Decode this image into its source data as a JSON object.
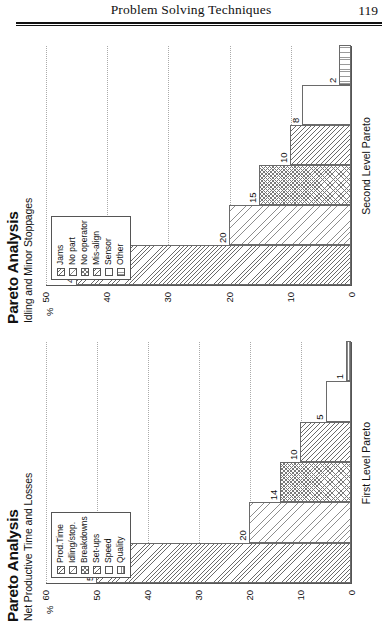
{
  "page": {
    "running_head": "Problem Solving Techniques",
    "folio": "119"
  },
  "figures": [
    {
      "id": "second-level",
      "title": "Pareto Analysis",
      "subtitle": "Idling and Minor Stoppages",
      "y_unit": "%",
      "x_axis_label": "Second Level Pareto",
      "legend": [
        {
          "label": "Jams",
          "pattern": "diag"
        },
        {
          "label": "No part",
          "pattern": "diag-l"
        },
        {
          "label": "No operator",
          "pattern": "cross"
        },
        {
          "label": "Mis-align",
          "pattern": "diag2"
        },
        {
          "label": "Sensor",
          "pattern": "plain"
        },
        {
          "label": "Other",
          "pattern": "vert"
        }
      ],
      "chart_data": {
        "type": "bar",
        "title": "Pareto Analysis - Idling and Minor Stoppages",
        "xlabel": "Second Level Pareto",
        "ylabel": "%",
        "ylim": [
          0,
          50
        ],
        "yticks": [
          0,
          10,
          20,
          30,
          40,
          50
        ],
        "grid": true,
        "legend_position": "top-left",
        "categories": [
          "Jams",
          "No part",
          "No operator",
          "Mis-align",
          "Sensor",
          "Other"
        ],
        "values": [
          45,
          20,
          15,
          10,
          8,
          2
        ],
        "data_labels": [
          "45",
          "20",
          "15",
          "10",
          "8",
          "2"
        ]
      }
    },
    {
      "id": "first-level",
      "title": "Pareto Analysis",
      "subtitle": "Net Productive Time and Losses",
      "y_unit": "%",
      "x_axis_label": "First Level Pareto",
      "legend": [
        {
          "label": "Prod.Time",
          "pattern": "diag"
        },
        {
          "label": "Idling/stop.",
          "pattern": "diag-l"
        },
        {
          "label": "Breakdowns",
          "pattern": "cross"
        },
        {
          "label": "Set-ups",
          "pattern": "diag2"
        },
        {
          "label": "Speed",
          "pattern": "plain"
        },
        {
          "label": "Quality",
          "pattern": "horiz"
        }
      ],
      "chart_data": {
        "type": "bar",
        "title": "Pareto Analysis - Net Productive Time and Losses",
        "xlabel": "First Level Pareto",
        "ylabel": "%",
        "ylim": [
          0,
          60
        ],
        "yticks": [
          0,
          10,
          20,
          30,
          40,
          50,
          60
        ],
        "grid": true,
        "legend_position": "top-left",
        "categories": [
          "Prod.Time",
          "Idling/stop.",
          "Breakdowns",
          "Set-ups",
          "Speed",
          "Quality"
        ],
        "values": [
          50,
          20,
          14,
          10,
          5,
          1
        ],
        "data_labels": [
          "50",
          "20",
          "14",
          "10",
          "5",
          "1"
        ]
      }
    }
  ]
}
